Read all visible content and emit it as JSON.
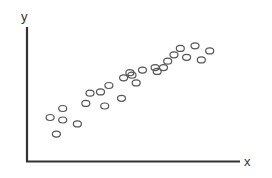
{
  "chart_data": {
    "type": "scatter",
    "title": "",
    "xlabel": "x",
    "ylabel": "y",
    "grid": false,
    "legend": null,
    "marker": "hollow-circle",
    "color": "#555555",
    "axis_color": "#333333",
    "xlim": [
      0,
      10
    ],
    "ylim": [
      0,
      10
    ],
    "points": [
      {
        "x": 1.1,
        "y": 3.4
      },
      {
        "x": 1.7,
        "y": 3.2
      },
      {
        "x": 1.7,
        "y": 4.1
      },
      {
        "x": 1.4,
        "y": 2.1
      },
      {
        "x": 2.4,
        "y": 2.9
      },
      {
        "x": 2.8,
        "y": 4.5
      },
      {
        "x": 3.0,
        "y": 5.3
      },
      {
        "x": 3.5,
        "y": 5.4
      },
      {
        "x": 3.9,
        "y": 5.9
      },
      {
        "x": 3.7,
        "y": 4.3
      },
      {
        "x": 4.5,
        "y": 4.9
      },
      {
        "x": 4.6,
        "y": 6.5
      },
      {
        "x": 4.9,
        "y": 6.9
      },
      {
        "x": 5.0,
        "y": 6.7
      },
      {
        "x": 5.2,
        "y": 6.1
      },
      {
        "x": 5.5,
        "y": 7.1
      },
      {
        "x": 6.1,
        "y": 7.3
      },
      {
        "x": 6.2,
        "y": 7.0
      },
      {
        "x": 6.5,
        "y": 7.3
      },
      {
        "x": 6.7,
        "y": 7.8
      },
      {
        "x": 7.0,
        "y": 8.3
      },
      {
        "x": 7.3,
        "y": 8.8
      },
      {
        "x": 7.6,
        "y": 8.1
      },
      {
        "x": 8.0,
        "y": 9.0
      },
      {
        "x": 8.3,
        "y": 7.9
      },
      {
        "x": 8.7,
        "y": 8.6
      }
    ]
  },
  "labels": {
    "x": "x",
    "y": "y"
  }
}
